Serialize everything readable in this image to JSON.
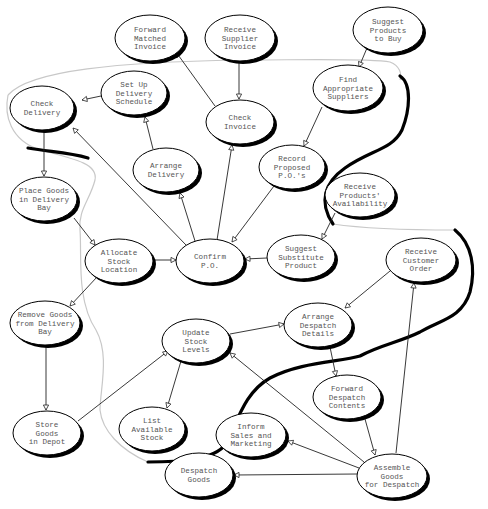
{
  "diagram": {
    "type": "data-flow / process bubble diagram",
    "nodes": [
      {
        "id": "forward-matched-invoice",
        "lines": [
          "Forward",
          "Matched",
          "Invoice"
        ],
        "cx": 150,
        "cy": 38,
        "rx": 35,
        "ry": 23
      },
      {
        "id": "receive-supplier-invoice",
        "lines": [
          "Receive",
          "Supplier",
          "Invoice"
        ],
        "cx": 240,
        "cy": 38,
        "rx": 35,
        "ry": 23
      },
      {
        "id": "suggest-products-to-buy",
        "lines": [
          "Suggest",
          "Products",
          "to Buy"
        ],
        "cx": 388,
        "cy": 30,
        "rx": 35,
        "ry": 23
      },
      {
        "id": "set-up-delivery-schedule",
        "lines": [
          "Set Up",
          "Delivery",
          "Schedule"
        ],
        "cx": 134,
        "cy": 93,
        "rx": 33,
        "ry": 22
      },
      {
        "id": "check-delivery",
        "lines": [
          "Check",
          "Delivery"
        ],
        "cx": 42,
        "cy": 108,
        "rx": 32,
        "ry": 22
      },
      {
        "id": "check-invoice",
        "lines": [
          "Check",
          "Invoice"
        ],
        "cx": 240,
        "cy": 122,
        "rx": 34,
        "ry": 22
      },
      {
        "id": "find-appropriate-suppliers",
        "lines": [
          "Find",
          "Appropriate",
          "Suppliers"
        ],
        "cx": 348,
        "cy": 88,
        "rx": 35,
        "ry": 23
      },
      {
        "id": "arrange-delivery",
        "lines": [
          "Arrange",
          "Delivery"
        ],
        "cx": 166,
        "cy": 170,
        "rx": 33,
        "ry": 22
      },
      {
        "id": "record-proposed-pos",
        "lines": [
          "Record",
          "Proposed",
          "P.O.'s"
        ],
        "cx": 292,
        "cy": 167,
        "rx": 33,
        "ry": 22
      },
      {
        "id": "receive-products-availability",
        "lines": [
          "Receive",
          "Products'",
          "Availability"
        ],
        "cx": 360,
        "cy": 195,
        "rx": 35,
        "ry": 22
      },
      {
        "id": "place-goods-in-delivery-bay",
        "lines": [
          "Place Goods",
          "in Delivery",
          "Bay"
        ],
        "cx": 44,
        "cy": 199,
        "rx": 33,
        "ry": 22
      },
      {
        "id": "allocate-stock-location",
        "lines": [
          "Allocate",
          "Stock",
          "Location"
        ],
        "cx": 119,
        "cy": 261,
        "rx": 34,
        "ry": 22
      },
      {
        "id": "confirm-po",
        "lines": [
          "Confirm",
          "P.O."
        ],
        "cx": 210,
        "cy": 261,
        "rx": 34,
        "ry": 22
      },
      {
        "id": "suggest-substitute-product",
        "lines": [
          "Suggest",
          "Substitute",
          "Product"
        ],
        "cx": 301,
        "cy": 257,
        "rx": 34,
        "ry": 22
      },
      {
        "id": "receive-customer-order",
        "lines": [
          "Receive",
          "Customer",
          "Order"
        ],
        "cx": 421,
        "cy": 260,
        "rx": 35,
        "ry": 22
      },
      {
        "id": "remove-goods-from-delivery-bay",
        "lines": [
          "Remove Goods",
          "from Delivery",
          "Bay"
        ],
        "cx": 45,
        "cy": 323,
        "rx": 35,
        "ry": 22
      },
      {
        "id": "update-stock-levels",
        "lines": [
          "Update",
          "Stock",
          "Levels"
        ],
        "cx": 196,
        "cy": 341,
        "rx": 34,
        "ry": 22
      },
      {
        "id": "arrange-despatch-details",
        "lines": [
          "Arrange",
          "Despatch",
          "Details"
        ],
        "cx": 318,
        "cy": 325,
        "rx": 34,
        "ry": 22
      },
      {
        "id": "list-available-stock",
        "lines": [
          "List",
          "Available",
          "Stock"
        ],
        "cx": 152,
        "cy": 429,
        "rx": 33,
        "ry": 22
      },
      {
        "id": "store-goods-in-depot",
        "lines": [
          "Store",
          "Goods",
          "in Depot"
        ],
        "cx": 47,
        "cy": 433,
        "rx": 34,
        "ry": 22
      },
      {
        "id": "forward-despatch-contents",
        "lines": [
          "Forward",
          "Despatch",
          "Contents"
        ],
        "cx": 347,
        "cy": 397,
        "rx": 34,
        "ry": 22
      },
      {
        "id": "inform-sales-and-marketing",
        "lines": [
          "Inform",
          "Sales and",
          "Marketing"
        ],
        "cx": 251,
        "cy": 435,
        "rx": 35,
        "ry": 22
      },
      {
        "id": "despatch-goods",
        "lines": [
          "Despatch",
          "Goods"
        ],
        "cx": 199,
        "cy": 475,
        "rx": 34,
        "ry": 22
      },
      {
        "id": "assemble-goods-for-despatch",
        "lines": [
          "Assemble",
          "Goods",
          "for Despatch"
        ],
        "cx": 392,
        "cy": 476,
        "rx": 35,
        "ry": 22
      }
    ],
    "edges": [
      {
        "from": "receive-supplier-invoice",
        "to": "check-invoice",
        "x1": 239,
        "y1": 61,
        "x2": 239,
        "y2": 99
      },
      {
        "from": "check-invoice",
        "to": "forward-matched-invoice",
        "x1": 215,
        "y1": 106,
        "x2": 176,
        "y2": 52
      },
      {
        "from": "suggest-products-to-buy",
        "to": "find-appropriate-suppliers",
        "x1": 367,
        "y1": 48,
        "x2": 359,
        "y2": 67
      },
      {
        "from": "find-appropriate-suppliers",
        "to": "record-proposed-pos",
        "x1": 322,
        "y1": 107,
        "x2": 304,
        "y2": 146
      },
      {
        "from": "set-up-delivery-schedule",
        "to": "check-delivery",
        "x1": 101,
        "y1": 96,
        "x2": 82,
        "y2": 100
      },
      {
        "from": "arrange-delivery",
        "to": "set-up-delivery-schedule",
        "x1": 153,
        "y1": 149,
        "x2": 145,
        "y2": 117
      },
      {
        "from": "confirm-po",
        "to": "check-delivery",
        "x1": 186,
        "y1": 245,
        "x2": 73,
        "y2": 128
      },
      {
        "from": "confirm-po",
        "to": "arrange-delivery",
        "x1": 195,
        "y1": 241,
        "x2": 180,
        "y2": 193
      },
      {
        "from": "confirm-po",
        "to": "check-invoice",
        "x1": 217,
        "y1": 240,
        "x2": 232,
        "y2": 145
      },
      {
        "from": "record-proposed-pos",
        "to": "confirm-po",
        "x1": 274,
        "y1": 186,
        "x2": 232,
        "y2": 242
      },
      {
        "from": "check-delivery",
        "to": "place-goods-in-delivery-bay",
        "x1": 44,
        "y1": 130,
        "x2": 44,
        "y2": 176
      },
      {
        "from": "place-goods-in-delivery-bay",
        "to": "allocate-stock-location",
        "x1": 74,
        "y1": 218,
        "x2": 95,
        "y2": 245
      },
      {
        "from": "allocate-stock-location",
        "to": "confirm-po",
        "x1": 153,
        "y1": 260,
        "x2": 176,
        "y2": 260
      },
      {
        "from": "receive-products-availability",
        "to": "suggest-substitute-product",
        "x1": 335,
        "y1": 213,
        "x2": 322,
        "y2": 239
      },
      {
        "from": "suggest-substitute-product",
        "to": "confirm-po",
        "x1": 267,
        "y1": 258,
        "x2": 245,
        "y2": 259
      },
      {
        "from": "allocate-stock-location",
        "to": "remove-goods-from-delivery-bay",
        "x1": 97,
        "y1": 277,
        "x2": 70,
        "y2": 306
      },
      {
        "from": "remove-goods-from-delivery-bay",
        "to": "store-goods-in-depot",
        "x1": 46,
        "y1": 346,
        "x2": 46,
        "y2": 410
      },
      {
        "from": "store-goods-in-depot",
        "to": "update-stock-levels",
        "x1": 78,
        "y1": 421,
        "x2": 168,
        "y2": 351
      },
      {
        "from": "update-stock-levels",
        "to": "list-available-stock",
        "x1": 181,
        "y1": 361,
        "x2": 167,
        "y2": 408
      },
      {
        "from": "update-stock-levels",
        "to": "arrange-despatch-details",
        "x1": 230,
        "y1": 334,
        "x2": 284,
        "y2": 324
      },
      {
        "from": "receive-customer-order",
        "to": "arrange-despatch-details",
        "x1": 390,
        "y1": 271,
        "x2": 345,
        "y2": 308
      },
      {
        "from": "arrange-despatch-details",
        "to": "forward-despatch-contents",
        "x1": 330,
        "y1": 347,
        "x2": 336,
        "y2": 376
      },
      {
        "from": "forward-despatch-contents",
        "to": "assemble-goods-for-despatch",
        "x1": 365,
        "y1": 419,
        "x2": 375,
        "y2": 455
      },
      {
        "from": "assemble-goods-for-despatch",
        "to": "update-stock-levels",
        "x1": 364,
        "y1": 462,
        "x2": 230,
        "y2": 353
      },
      {
        "from": "assemble-goods-for-despatch",
        "to": "inform-sales-and-marketing",
        "x1": 359,
        "y1": 468,
        "x2": 288,
        "y2": 441
      },
      {
        "from": "assemble-goods-for-despatch",
        "to": "despatch-goods",
        "x1": 357,
        "y1": 474,
        "x2": 234,
        "y2": 475
      },
      {
        "from": "assemble-goods-for-despatch",
        "to": "receive-customer-order",
        "x1": 396,
        "y1": 453,
        "x2": 414,
        "y2": 283
      }
    ],
    "boundaries": {
      "thin_outline": "M 8 95 C 30 70, 120 62, 240 60 C 300 60, 370 58, 390 62 C 400 66, 402 74, 400 80",
      "thin_outline_left": "M 8 95 C 4 115, 10 140, 40 150 C 80 160, 98 165, 95 180 C 90 200, 78 210, 80 230 C 82 255, 76 300, 96 330 C 110 355, 100 390, 100 410 C 102 430, 120 450, 148 462",
      "thin_outline_right": "M 333 224 C 360 228, 400 230, 455 230",
      "thick_line_top": "M 400 76 C 412 84, 410 110, 402 130 C 392 150, 370 150, 345 168 C 325 182, 318 202, 333 224",
      "thick_line_right": "M 455 230 C 472 244, 476 268, 470 292 C 462 318, 440 320, 420 332 C 400 342, 380 345, 360 356 C 340 362, 300 362, 270 378 C 245 392, 238 420, 226 444 C 214 460, 180 462, 148 462",
      "thick_line_left": "M 28 148 C 50 152, 68 152, 88 158"
    }
  }
}
